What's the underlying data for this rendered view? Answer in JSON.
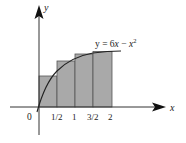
{
  "diagram": {
    "type": "riemann-sum-right-endpoint",
    "function_label": "y = 6x − x²",
    "function_label_parts": {
      "lhs": "y = 6",
      "x1": "x",
      "minus": " − ",
      "x2": "x",
      "exp": "2"
    },
    "axes": {
      "x_label": "x",
      "y_label": "y",
      "origin_label": "0"
    },
    "ticks": [
      {
        "label": "1/2",
        "value": 0.5
      },
      {
        "label": "1",
        "value": 1
      },
      {
        "label": "3/2",
        "value": 1.5
      },
      {
        "label": "2",
        "value": 2
      }
    ],
    "rectangles": [
      {
        "x_start": 0,
        "x_end": 0.5,
        "height_expr": "f(1/2)",
        "height": 2.75
      },
      {
        "x_start": 0.5,
        "x_end": 1,
        "height_expr": "f(1)",
        "height": 5
      },
      {
        "x_start": 1,
        "x_end": 1.5,
        "height_expr": "f(3/2)",
        "height": 6.75
      },
      {
        "x_start": 1.5,
        "x_end": 2,
        "height_expr": "f(2)",
        "height": 8
      }
    ],
    "colors": {
      "rect_fill": "#a9a9a9",
      "rect_stroke": "#555555",
      "axis": "#333333",
      "curve": "#222222"
    }
  }
}
